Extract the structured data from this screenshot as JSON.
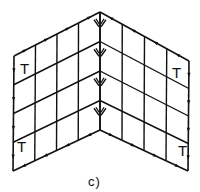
{
  "figure": {
    "caption": "c)",
    "stroke_color": "#111111",
    "background": "#ffffff",
    "grid_divisions": 4,
    "panels": [
      {
        "name": "left",
        "corners": {
          "outer_top": [
            14,
            56
          ],
          "inner_top": [
            100,
            12
          ],
          "inner_bottom": [
            100,
            130
          ],
          "outer_bottom": [
            13,
            171
          ]
        },
        "t_labels": [
          {
            "text": "T",
            "x": 20,
            "y": 74
          },
          {
            "text": "T",
            "x": 17,
            "y": 152
          }
        ]
      },
      {
        "name": "right",
        "corners": {
          "outer_top": [
            189,
            61
          ],
          "inner_top": [
            100,
            12
          ],
          "inner_bottom": [
            100,
            130
          ],
          "outer_bottom": [
            188,
            171
          ]
        },
        "t_labels": [
          {
            "text": "T",
            "x": 172,
            "y": 78
          },
          {
            "text": "T",
            "x": 178,
            "y": 156
          }
        ]
      }
    ],
    "seam_symbol": "double-chevron arrow marks along central fold"
  }
}
